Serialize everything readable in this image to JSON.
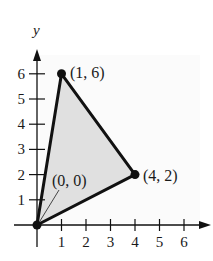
{
  "chart_data": {
    "type": "scatter",
    "title": "",
    "xlabel": "",
    "ylabel": "y",
    "xlim": [
      0,
      7
    ],
    "ylim": [
      0,
      7
    ],
    "x_ticks": [
      1,
      2,
      3,
      4,
      5,
      6
    ],
    "y_ticks": [
      1,
      2,
      3,
      4,
      5,
      6
    ],
    "grid": false,
    "legend": null,
    "shape": "filled-triangle",
    "fill_color": "#e0e0e0",
    "stroke_color": "#111111",
    "points": [
      {
        "x": 0,
        "y": 0,
        "label": "(0, 0)"
      },
      {
        "x": 1,
        "y": 6,
        "label": "(1, 6)"
      },
      {
        "x": 4,
        "y": 2,
        "label": "(4, 2)"
      }
    ],
    "annotations": [
      "(0, 0)",
      "(1, 6)",
      "(4, 2)"
    ]
  },
  "axes": {
    "y_axis_label": "y",
    "x_tick_labels": [
      "1",
      "2",
      "3",
      "4",
      "5",
      "6"
    ],
    "y_tick_labels": [
      "1",
      "2",
      "3",
      "4",
      "5",
      "6"
    ]
  },
  "labels": {
    "origin": "(0, 0)",
    "top_vertex": "(1, 6)",
    "right_vertex": "(4, 2)"
  }
}
